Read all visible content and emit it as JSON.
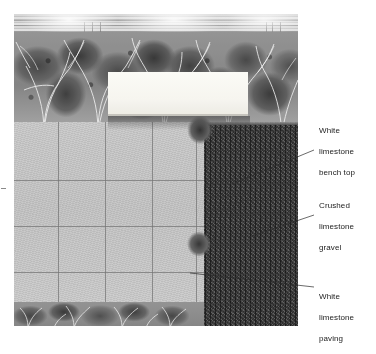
{
  "figure": {
    "type": "annotated-photograph",
    "photo": {
      "name": "courtyard-photo",
      "regions": [
        {
          "id": "fence",
          "label": "horizontal slatted fence / wall"
        },
        {
          "id": "planting",
          "label": "shrub planting bed"
        },
        {
          "id": "paving",
          "label": "limestone paving grid"
        },
        {
          "id": "gravel",
          "label": "crushed gravel bed"
        },
        {
          "id": "bench",
          "label": "bench top slab"
        }
      ]
    }
  },
  "callouts": [
    {
      "id": "bench-top",
      "line1": "White",
      "line2": "limestone",
      "line3": "bench top"
    },
    {
      "id": "gravel",
      "line1": "Crushed",
      "line2": "limestone",
      "line3": "gravel"
    },
    {
      "id": "paving",
      "line1": "White",
      "line2": "limestone",
      "line3": "paving"
    }
  ],
  "colors": {
    "text": "#1b1b1b",
    "leader_line": "#2b2b2b",
    "paving_light": "#c4c4c4",
    "paving_joint": "#6e6e6e",
    "gravel_dark": "#262626",
    "bench_white": "#fbfbf6",
    "background": "#ffffff"
  }
}
